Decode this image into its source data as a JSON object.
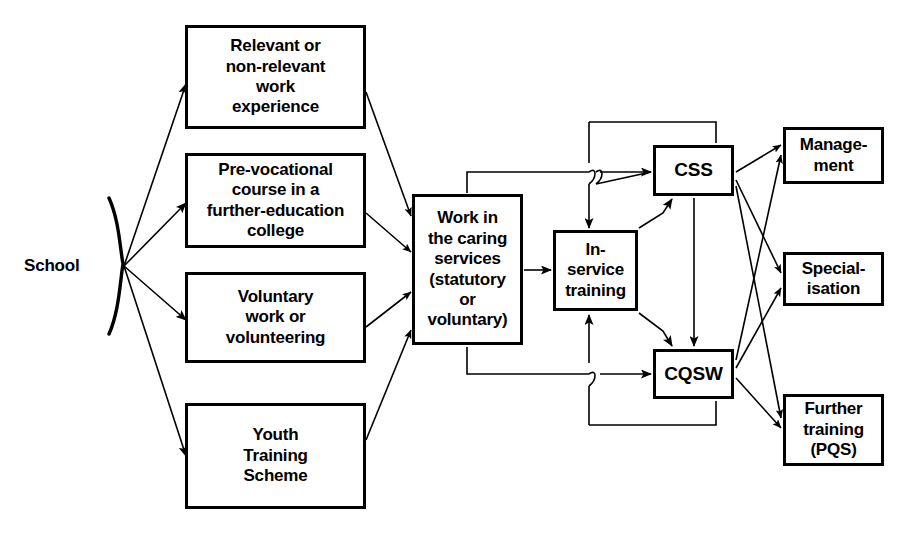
{
  "diagram": {
    "source": {
      "label": "School",
      "brace_icon": "curly-brace-icon"
    },
    "entry_routes": [
      {
        "id": "work-experience",
        "label": "Relevant or\nnon-relevant\nwork\nexperience"
      },
      {
        "id": "pre-vocational",
        "label": "Pre-vocational\ncourse in a\nfurther-education\ncollege"
      },
      {
        "id": "voluntary-work",
        "label": "Voluntary\nwork or\nvolunteering"
      },
      {
        "id": "youth-training",
        "label": "Youth\nTraining\nScheme"
      }
    ],
    "employment": {
      "id": "caring-services",
      "label": "Work in\nthe caring\nservices\n(statutory\nor\nvoluntary)"
    },
    "training": {
      "id": "in-service",
      "label": "In-\nservice\ntraining"
    },
    "qualifications": [
      {
        "id": "css",
        "label": "CSS"
      },
      {
        "id": "cqsw",
        "label": "CQSW"
      }
    ],
    "outcomes": [
      {
        "id": "management",
        "label": "Manage-\nment"
      },
      {
        "id": "specialisation",
        "label": "Special-\nisation"
      },
      {
        "id": "further-training",
        "label": "Further\ntraining\n(PQS)"
      }
    ],
    "style": {
      "line_color": "#000000",
      "box_border_color": "#000000",
      "box_fill": "#ffffff",
      "page_background": "#ffffff"
    }
  }
}
